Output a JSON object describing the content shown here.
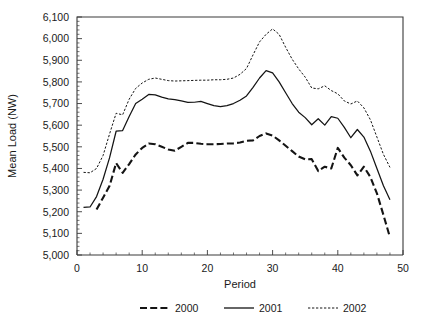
{
  "chart_data": {
    "type": "line",
    "title": "",
    "xlabel": "Period",
    "ylabel": "Mean Load (NW)",
    "xlim": [
      0,
      50
    ],
    "ylim": [
      5000,
      6100
    ],
    "grid": false,
    "legend_position": "bottom",
    "x_ticks": [
      0,
      10,
      20,
      30,
      40,
      50
    ],
    "x_tick_labels": [
      "0",
      "10",
      "20",
      "30",
      "40",
      "50"
    ],
    "x_minor_tick_step": 2,
    "y_ticks": [
      5000,
      5100,
      5200,
      5300,
      5400,
      5500,
      5600,
      5700,
      5800,
      5900,
      6000,
      6100
    ],
    "y_tick_labels": [
      "5,000",
      "5,100",
      "5,200",
      "5,300",
      "5,400",
      "5,500",
      "5,600",
      "5,700",
      "5,800",
      "5,900",
      "6,000",
      "6,100"
    ],
    "y_minor_tick_step": 20,
    "series": [
      {
        "name": "2000",
        "style": "dashed-thick",
        "color": "#141414",
        "x": [
          3,
          4,
          5,
          6,
          7,
          8,
          9,
          10,
          11,
          12,
          13,
          14,
          15,
          16,
          17,
          18,
          19,
          20,
          21,
          22,
          23,
          24,
          25,
          26,
          27,
          28,
          29,
          30,
          31,
          32,
          33,
          34,
          35,
          36,
          37,
          38,
          39,
          40,
          41,
          42,
          43,
          44,
          45,
          46,
          47,
          48
        ],
        "y": [
          5210,
          5265,
          5320,
          5425,
          5380,
          5420,
          5465,
          5495,
          5515,
          5512,
          5500,
          5488,
          5482,
          5500,
          5518,
          5518,
          5514,
          5512,
          5512,
          5513,
          5515,
          5516,
          5520,
          5528,
          5530,
          5550,
          5562,
          5552,
          5530,
          5505,
          5480,
          5455,
          5442,
          5443,
          5388,
          5408,
          5400,
          5495,
          5450,
          5415,
          5368,
          5408,
          5360,
          5285,
          5185,
          5082
        ]
      },
      {
        "name": "2001",
        "style": "solid",
        "color": "#141414",
        "x": [
          1,
          2,
          3,
          4,
          5,
          6,
          7,
          8,
          9,
          10,
          11,
          12,
          13,
          14,
          15,
          16,
          17,
          18,
          19,
          20,
          21,
          22,
          23,
          24,
          25,
          26,
          27,
          28,
          29,
          30,
          31,
          32,
          33,
          34,
          35,
          36,
          37,
          38,
          39,
          40,
          41,
          42,
          43,
          44,
          45,
          46,
          47,
          48
        ],
        "y": [
          5220,
          5222,
          5270,
          5350,
          5450,
          5572,
          5575,
          5640,
          5700,
          5720,
          5742,
          5740,
          5730,
          5722,
          5718,
          5712,
          5705,
          5706,
          5710,
          5700,
          5690,
          5686,
          5690,
          5700,
          5715,
          5735,
          5775,
          5818,
          5852,
          5842,
          5800,
          5750,
          5700,
          5660,
          5635,
          5602,
          5630,
          5600,
          5640,
          5632,
          5590,
          5542,
          5580,
          5545,
          5480,
          5400,
          5320,
          5255
        ]
      },
      {
        "name": "2002",
        "style": "dotted-thin",
        "color": "#141414",
        "x": [
          1,
          2,
          3,
          4,
          5,
          6,
          7,
          8,
          9,
          10,
          11,
          12,
          13,
          14,
          15,
          16,
          17,
          18,
          19,
          20,
          21,
          22,
          23,
          24,
          25,
          26,
          27,
          28,
          29,
          30,
          31,
          32,
          33,
          34,
          35,
          36,
          37,
          38,
          39,
          40,
          41,
          42,
          43,
          44,
          45,
          46,
          47,
          48
        ],
        "y": [
          5382,
          5380,
          5400,
          5460,
          5560,
          5655,
          5648,
          5720,
          5770,
          5795,
          5812,
          5818,
          5812,
          5806,
          5804,
          5805,
          5806,
          5807,
          5808,
          5808,
          5810,
          5810,
          5812,
          5818,
          5835,
          5862,
          5925,
          5985,
          6020,
          6045,
          6020,
          5960,
          5905,
          5860,
          5822,
          5772,
          5768,
          5782,
          5760,
          5745,
          5712,
          5698,
          5712,
          5680,
          5625,
          5545,
          5465,
          5405
        ]
      }
    ],
    "legend": [
      {
        "label": "2000",
        "style": "dashed-thick"
      },
      {
        "label": "2001",
        "style": "solid"
      },
      {
        "label": "2002",
        "style": "dotted-thin"
      }
    ]
  },
  "layout": {
    "plot_left": 77,
    "plot_right": 403,
    "plot_top": 17,
    "plot_bottom": 255
  }
}
